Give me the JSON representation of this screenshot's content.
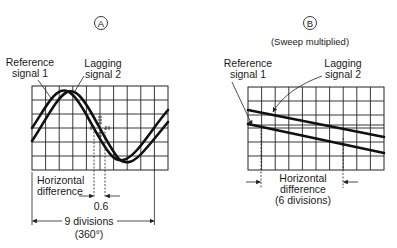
{
  "panel_a": {
    "marker": "A",
    "label_reference": [
      "Reference",
      "signal 1"
    ],
    "label_lagging": [
      "Lagging",
      "signal 2"
    ],
    "label_horizontal": [
      "Horizontal",
      "difference"
    ],
    "value_difference": "0.6",
    "label_divisions": "9 divisions",
    "label_degrees": "(360°)",
    "grid": {
      "columns": 10,
      "rows": 6
    }
  },
  "panel_b": {
    "marker": "B",
    "subtitle": "(Sweep multiplied)",
    "label_reference": [
      "Reference",
      "signal 1"
    ],
    "label_lagging": [
      "Lagging",
      "signal 2"
    ],
    "label_horizontal": [
      "Horizontal",
      "difference",
      "(6 divisions)"
    ],
    "grid": {
      "columns": 10,
      "rows": 6
    }
  }
}
